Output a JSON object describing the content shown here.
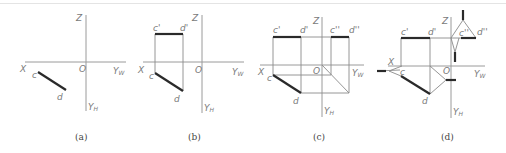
{
  "figure": {
    "panels": [
      {
        "id": "a",
        "caption": "(a)",
        "labels": {
          "z": "Z",
          "x": "X",
          "o": "O",
          "yw": "Y",
          "yw_sub": "W",
          "yh": "Y",
          "yh_sub": "H",
          "c": "c",
          "d": "d"
        }
      },
      {
        "id": "b",
        "caption": "(b)",
        "labels": {
          "z": "Z",
          "x": "X",
          "o": "O",
          "yw": "Y",
          "yw_sub": "W",
          "yh": "Y",
          "yh_sub": "H",
          "c": "c",
          "d": "d",
          "c1": "c'",
          "d1": "d'"
        }
      },
      {
        "id": "c",
        "caption": "(c)",
        "labels": {
          "z": "Z",
          "x": "X",
          "o": "O",
          "yw": "Y",
          "yw_sub": "W",
          "yh": "Y",
          "yh_sub": "H",
          "c": "c",
          "d": "d",
          "c1": "c'",
          "d1": "d'",
          "c2": "c''",
          "d2": "d''"
        }
      },
      {
        "id": "d",
        "caption": "(d)",
        "labels": {
          "z": "Z",
          "x": "X",
          "o": "O",
          "yw": "Y",
          "yw_sub": "W",
          "yh": "Y",
          "yh_sub": "H",
          "c": "c",
          "d": "d",
          "c1": "c'",
          "d1": "d'",
          "c2": "c''",
          "d2": "d''"
        }
      }
    ],
    "colors": {
      "axis": "#9a9a9a",
      "projection_line": "#2a2a2a",
      "label": "#7a7a7a"
    }
  }
}
